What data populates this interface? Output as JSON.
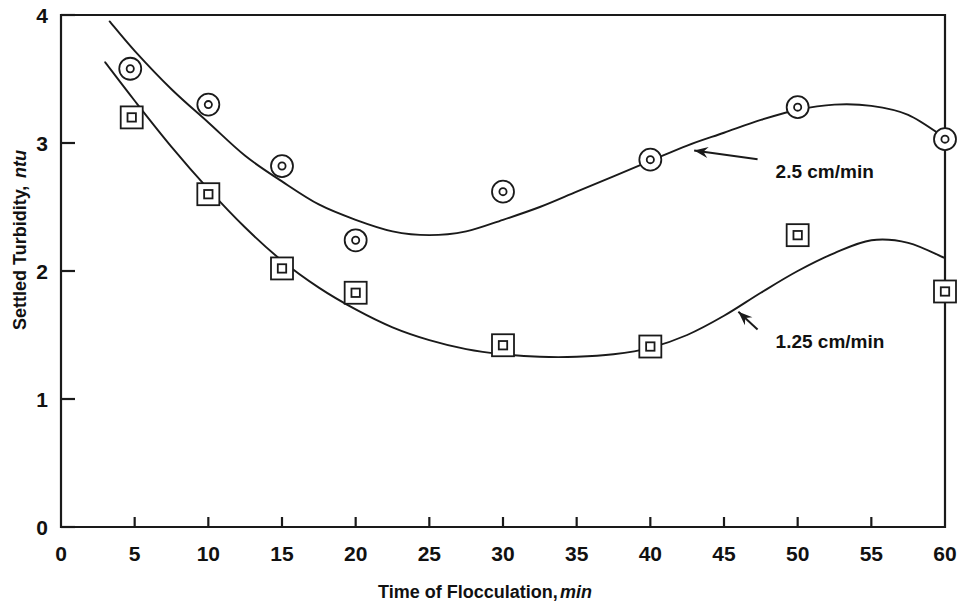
{
  "chart_data": {
    "type": "scatter",
    "title": "",
    "xlabel": "Time of Flocculation, min",
    "xlabel_main": "Time of Flocculation,",
    "xlabel_italic": "min",
    "ylabel": "Settled Turbidity, ntu",
    "ylabel_main": "Settled Turbidity,",
    "ylabel_italic": "ntu",
    "xlim": [
      0,
      60
    ],
    "ylim": [
      0,
      4
    ],
    "xticks": [
      0,
      5,
      10,
      15,
      20,
      25,
      30,
      35,
      40,
      45,
      50,
      55,
      60
    ],
    "xticklabels": [
      "0",
      "5",
      "10",
      "15",
      "20",
      "25",
      "30",
      "35",
      "40",
      "45",
      "50",
      "55",
      "60"
    ],
    "yticks": [
      0,
      1,
      2,
      3,
      4
    ],
    "yticklabels": [
      "0",
      "1",
      "2",
      "3",
      "4"
    ],
    "grid": false,
    "legend_position": "inline-annotations",
    "series": [
      {
        "name": "2.5 cm/min",
        "marker": "circle-dot",
        "x": [
          4.7,
          10,
          15,
          20,
          30,
          40,
          50,
          60
        ],
        "values": [
          3.58,
          3.3,
          2.82,
          2.24,
          2.62,
          2.87,
          3.28,
          3.03
        ],
        "fit_curve": [
          [
            3.3,
            3.95
          ],
          [
            5,
            3.72
          ],
          [
            7.5,
            3.42
          ],
          [
            10,
            3.16
          ],
          [
            12.5,
            2.9
          ],
          [
            15,
            2.7
          ],
          [
            17.5,
            2.52
          ],
          [
            20,
            2.4
          ],
          [
            22.5,
            2.31
          ],
          [
            25,
            2.28
          ],
          [
            27.5,
            2.31
          ],
          [
            30,
            2.4
          ],
          [
            32.5,
            2.5
          ],
          [
            35,
            2.62
          ],
          [
            37.5,
            2.74
          ],
          [
            40,
            2.86
          ],
          [
            42.5,
            2.98
          ],
          [
            45,
            3.08
          ],
          [
            47.5,
            3.18
          ],
          [
            50,
            3.26
          ],
          [
            52.5,
            3.3
          ],
          [
            55,
            3.29
          ],
          [
            57.5,
            3.22
          ],
          [
            60,
            3.04
          ]
        ]
      },
      {
        "name": "1.25 cm/min",
        "marker": "square-dot",
        "x": [
          4.8,
          10,
          15,
          20,
          30,
          40,
          50,
          60
        ],
        "values": [
          3.2,
          2.6,
          2.02,
          1.83,
          1.42,
          1.41,
          2.28,
          1.84
        ],
        "fit_curve": [
          [
            3.0,
            3.63
          ],
          [
            5,
            3.33
          ],
          [
            7.5,
            2.97
          ],
          [
            10,
            2.64
          ],
          [
            12.5,
            2.34
          ],
          [
            15,
            2.08
          ],
          [
            17.5,
            1.87
          ],
          [
            20,
            1.7
          ],
          [
            22.5,
            1.56
          ],
          [
            25,
            1.46
          ],
          [
            27.5,
            1.39
          ],
          [
            30,
            1.35
          ],
          [
            32.5,
            1.33
          ],
          [
            35,
            1.33
          ],
          [
            37.5,
            1.35
          ],
          [
            40,
            1.4
          ],
          [
            42.5,
            1.5
          ],
          [
            45,
            1.65
          ],
          [
            47.5,
            1.83
          ],
          [
            50,
            2.0
          ],
          [
            52.5,
            2.14
          ],
          [
            55,
            2.24
          ],
          [
            57.5,
            2.22
          ],
          [
            60,
            2.1
          ]
        ]
      }
    ],
    "annotations": [
      {
        "text": "2.5 cm/min",
        "target_x": 42.5,
        "target_y": 2.98,
        "label_x": 48.5,
        "label_y": 2.78
      },
      {
        "text": "1.25 cm/min",
        "target_x": 45.5,
        "target_y": 1.72,
        "label_x": 48.5,
        "label_y": 1.45
      }
    ]
  },
  "colors": {
    "axis": "#1a1a1a",
    "curve": "#1a1a1a",
    "marker_fill": "#ffffff",
    "background": "#ffffff"
  }
}
